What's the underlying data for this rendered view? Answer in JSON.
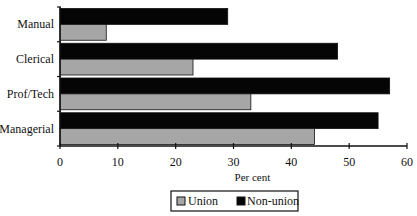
{
  "chart_data": {
    "type": "bar",
    "orientation": "horizontal",
    "title": "",
    "xlabel": "Per cent",
    "ylabel": "",
    "categories": [
      "Manual",
      "Clerical",
      "Prof/Tech",
      "Managerial"
    ],
    "series": [
      {
        "name": "Union",
        "color": "#a6a6a6",
        "values": [
          8,
          23,
          33,
          44
        ]
      },
      {
        "name": "Non-union",
        "color": "#050505",
        "values": [
          29,
          48,
          57,
          55
        ]
      }
    ],
    "xlim": [
      0,
      60
    ],
    "xticks": [
      0,
      10,
      20,
      30,
      40,
      50,
      60
    ],
    "grid": false,
    "legend": {
      "position": "bottom-center",
      "entries": [
        "Union",
        "Non-union"
      ]
    }
  }
}
